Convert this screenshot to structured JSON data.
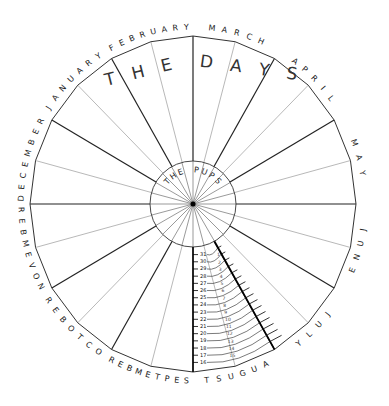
{
  "diagram": {
    "center_label": "THE PUPS",
    "months_clockwise_from_top": [
      "MARCH",
      "APRIL",
      "MAY",
      "JUNE",
      "JULY",
      "AUGUST",
      "SEPTEMBER",
      "OCTOBER",
      "NOVEMBER",
      "DECEMBER",
      "JANUARY",
      "FEBRUARY"
    ],
    "sectors_per_month": 2,
    "total_spokes": 24,
    "scale_month": "AUGUST",
    "scale_outer_days": [
      "31",
      "30",
      "29",
      "28",
      "27",
      "26",
      "25",
      "24",
      "23",
      "22",
      "21",
      "20",
      "19",
      "18",
      "17",
      "16"
    ],
    "scale_inner_days": [
      "1",
      "2",
      "3",
      "4",
      "5",
      "6",
      "7",
      "8",
      "9",
      "10",
      "11",
      "12",
      "13",
      "14",
      "15"
    ],
    "colors": {
      "line": "#222222",
      "thin_line": "#888888",
      "background": "#ffffff"
    }
  }
}
